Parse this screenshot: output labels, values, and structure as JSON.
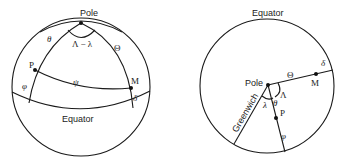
{
  "left_diagram": {
    "pole_label": "Pole",
    "equator_label": "Equator",
    "angle_label": "Λ − λ",
    "theta_label": "θ",
    "Theta_label": "Θ",
    "psi_label": "ψ",
    "phi_label": "φ",
    "delta_label": "δ",
    "point_p_label": "P",
    "point_m_label": "M"
  },
  "right_diagram": {
    "equator_label": "Equator",
    "pole_label": "Pole",
    "greenwich_label": "Greenwich",
    "Theta_label": "Θ",
    "delta_label": "δ",
    "point_m_label": "M",
    "point_p_label": "P",
    "Lambda_label": "Λ",
    "lambda_label": "λ",
    "theta_label": "θ",
    "phi_label": "φ"
  },
  "colors": {
    "stroke": "#1a1a1a",
    "background": "#ffffff"
  }
}
